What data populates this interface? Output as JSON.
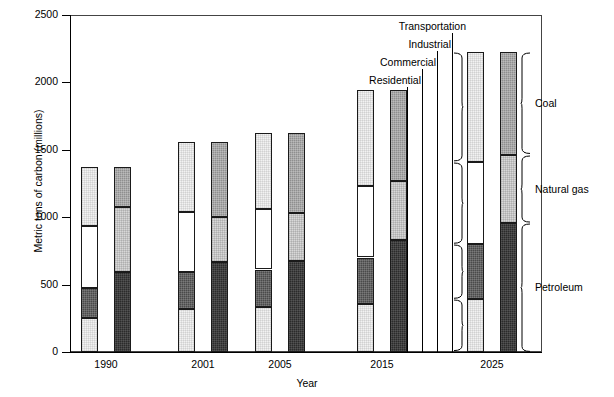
{
  "chart_data": {
    "type": "bar",
    "subtype": "paired-stacked-bar",
    "title": "",
    "xlabel": "Year",
    "ylabel": "Metric tons of carbon (millions)",
    "categories": [
      "1990",
      "2001",
      "2005",
      "2015",
      "2025"
    ],
    "ylim": [
      0,
      2500
    ],
    "yticks": [
      0,
      500,
      1000,
      1500,
      2000,
      2500
    ],
    "ytick_labels": [
      "0",
      "500",
      "1000",
      "1500",
      "2000",
      "2500"
    ],
    "grid": false,
    "legend_position": "annotated-braces",
    "bar_groups": [
      {
        "name": "End-use sector",
        "position": "left",
        "stack_order_bottom_to_top": [
          "Residential",
          "Commercial",
          "Industrial",
          "Transportation"
        ],
        "series": [
          {
            "name": "Residential",
            "values": [
              253,
              320,
              335,
              355,
              390
            ],
            "fill": "vlight"
          },
          {
            "name": "Commercial",
            "values": [
              219,
              272,
              277,
              346,
              410
            ],
            "fill": "dark"
          },
          {
            "name": "Industrial",
            "values": [
              464,
              447,
              450,
              530,
              610
            ],
            "fill": "white"
          },
          {
            "name": "Transportation",
            "values": [
              434,
              516,
              560,
              709,
              815
            ],
            "fill": "vlight-top"
          }
        ],
        "totals": [
          1370,
          1555,
          1622,
          1940,
          2225
        ]
      },
      {
        "name": "Fuel type",
        "position": "right",
        "stack_order_bottom_to_top": [
          "Petroleum",
          "Natural gas",
          "Coal"
        ],
        "series": [
          {
            "name": "Petroleum",
            "values": [
              591,
              664,
              675,
              828,
              960
            ],
            "fill": "vdark"
          },
          {
            "name": "Natural gas",
            "values": [
              482,
              335,
              357,
              438,
              505
            ],
            "fill": "light"
          },
          {
            "name": "Coal",
            "values": [
              297,
              556,
              590,
              674,
              760
            ],
            "fill": "mid"
          }
        ],
        "totals": [
          1370,
          1555,
          1622,
          1940,
          2225
        ]
      }
    ]
  },
  "axes": {
    "y_label": "Metric tons of carbon (millions)",
    "x_label": "Year",
    "y_ticks": [
      {
        "value": 2500,
        "label": "2500"
      },
      {
        "value": 2000,
        "label": "2000"
      },
      {
        "value": 1500,
        "label": "1500"
      },
      {
        "value": 1000,
        "label": "1000"
      },
      {
        "value": 500,
        "label": "500"
      },
      {
        "value": 0,
        "label": "0"
      }
    ],
    "x_ticks": [
      {
        "label": "1990"
      },
      {
        "label": "2001"
      },
      {
        "label": "2005"
      },
      {
        "label": "2015"
      },
      {
        "label": "2025"
      }
    ]
  },
  "annotations": {
    "sector_labels": [
      {
        "label": "Transportation"
      },
      {
        "label": "Industrial"
      },
      {
        "label": "Commercial"
      },
      {
        "label": "Residential"
      }
    ],
    "fuel_labels": [
      {
        "label": "Coal"
      },
      {
        "label": "Natural gas"
      },
      {
        "label": "Petroleum"
      }
    ]
  },
  "colors": {
    "axis": "#000000",
    "frame": "#444444",
    "residential": "#f2f2f2",
    "commercial": "#4a4a4a",
    "industrial": "#ffffff",
    "transportation": "#f7f7f7",
    "petroleum": "#2b2b2b",
    "natural_gas": "#d8d8d8",
    "coal": "#8f8f8f"
  }
}
